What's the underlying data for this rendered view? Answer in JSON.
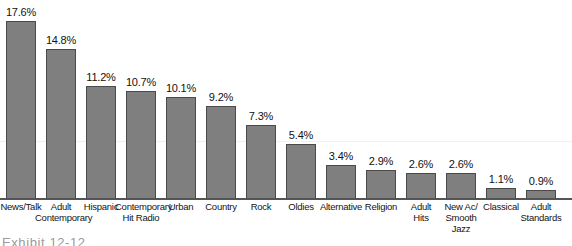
{
  "chart_data": {
    "type": "bar",
    "title": "",
    "subtitle": "",
    "xlabel": "",
    "ylabel": "",
    "ylim": [
      0,
      17.6
    ],
    "grid": false,
    "legend": null,
    "bar_color": "#7f7f7f",
    "bar_border_color": "#4a4a4a",
    "axis_color": "#555555",
    "value_suffix": "%",
    "categories": [
      "News/Talk",
      "Adult Contemporary",
      "Hispanic",
      "Contemporary Hit Radio",
      "Urban",
      "Country",
      "Rock",
      "Oldies",
      "Alternative",
      "Religion",
      "Adult Hits",
      "New Ac/ Smooth Jazz",
      "Classical",
      "Adult Standards"
    ],
    "category_lines": [
      [
        "News/Talk"
      ],
      [
        "Adult",
        "Contemporary"
      ],
      [
        "Hispanic"
      ],
      [
        "Contemporary",
        "Hit Radio"
      ],
      [
        "Urban"
      ],
      [
        "Country"
      ],
      [
        "Rock"
      ],
      [
        "Oldies"
      ],
      [
        "Alternative"
      ],
      [
        "Religion"
      ],
      [
        "Adult",
        "Hits"
      ],
      [
        "New Ac/",
        "Smooth Jazz"
      ],
      [
        "Classical"
      ],
      [
        "Adult",
        "Standards"
      ]
    ],
    "values": [
      17.6,
      14.8,
      11.2,
      10.7,
      10.1,
      9.2,
      7.3,
      5.4,
      3.4,
      2.9,
      2.6,
      2.6,
      1.1,
      0.9
    ],
    "value_labels": [
      "17.6%",
      "14.8%",
      "11.2%",
      "10.7%",
      "10.1%",
      "9.2%",
      "7.3%",
      "5.4%",
      "3.4%",
      "2.9%",
      "2.6%",
      "2.6%",
      "1.1%",
      "0.9%"
    ]
  },
  "caption": {
    "text": "Exhibit 12-12"
  }
}
